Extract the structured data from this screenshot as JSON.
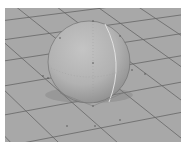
{
  "viewport": {
    "type": "3d-perspective-view",
    "background_color": "#a8a8a8",
    "grid_line_color": "#555555",
    "object": {
      "shape": "sphere",
      "color": "#b4b4b4",
      "highlight_color": "#c8c8c8",
      "shadow_color": "#8c8c8c",
      "selected_edge_color": "#e6e6e6"
    }
  }
}
